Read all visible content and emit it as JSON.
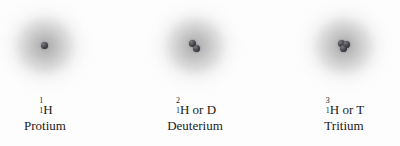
{
  "figure": {
    "background_color": "#fdfdfd",
    "text_color": "#1b1b1b",
    "nucleon_color": "#33333a",
    "cloud_color": "#8c8c8c"
  },
  "isotopes": [
    {
      "mass_number": "1",
      "atomic_number": "1",
      "symbol": "H",
      "alt_symbol_text": "",
      "name": "Protium",
      "nucleon_count": 1
    },
    {
      "mass_number": "2",
      "atomic_number": "1",
      "symbol": "H",
      "alt_symbol_text": " or D",
      "name": "Deuterium",
      "nucleon_count": 2
    },
    {
      "mass_number": "3",
      "atomic_number": "1",
      "symbol": "H",
      "alt_symbol_text": " or T",
      "name": "Tritium",
      "nucleon_count": 3
    }
  ]
}
